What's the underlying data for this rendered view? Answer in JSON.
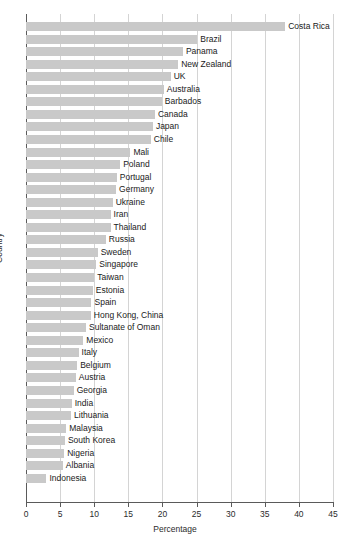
{
  "chart_data": {
    "type": "bar",
    "orientation": "horizontal",
    "title": "",
    "xlabel": "Percentage",
    "ylabel": "Country",
    "xlim": [
      0,
      45
    ],
    "ylim": null,
    "grid": "vertical",
    "legend": null,
    "xticks": [
      "0",
      "5",
      "10",
      "15",
      "20",
      "25",
      "30",
      "35",
      "40",
      "45"
    ],
    "xtick_values": [
      0,
      5,
      10,
      15,
      20,
      25,
      30,
      35,
      40,
      45
    ],
    "bar_color": "#c9c9c9",
    "categories": [
      "Costa Rica",
      "Brazil",
      "Panama",
      "New Zealand",
      "UK",
      "Australia",
      "Barbados",
      "Canada",
      "Japan",
      "Chile",
      "Mali",
      "Poland",
      "Portugal",
      "Germany",
      "Ukraine",
      "Iran",
      "Thailand",
      "Russia",
      "Sweden",
      "Singapore",
      "Taiwan",
      "Estonia",
      "Spain",
      "Hong Kong, China",
      "Sultanate of Oman",
      "Mexico",
      "Italy",
      "Belgium",
      "Austria",
      "Georgia",
      "India",
      "Lithuania",
      "Malaysia",
      "South Korea",
      "Nigeria",
      "Albania",
      "Indonesia"
    ],
    "values": [
      38.0,
      25.1,
      23.0,
      22.3,
      21.2,
      20.2,
      19.9,
      18.9,
      18.6,
      18.3,
      15.3,
      13.8,
      13.3,
      13.2,
      12.7,
      12.4,
      12.4,
      11.7,
      10.5,
      10.3,
      10.0,
      9.8,
      9.6,
      9.5,
      8.8,
      8.4,
      7.7,
      7.5,
      7.3,
      7.0,
      6.7,
      6.6,
      5.9,
      5.7,
      5.6,
      5.4,
      3.0
    ]
  }
}
